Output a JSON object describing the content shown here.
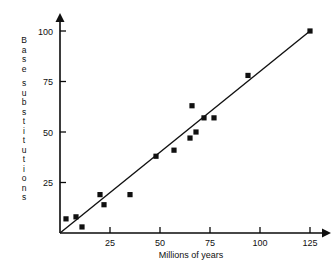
{
  "chart_data": {
    "type": "scatter",
    "title": "",
    "xlabel": "Millions of years",
    "ylabel": "Base substitutions",
    "ylabel_chars": [
      "B",
      "a",
      "s",
      "e",
      "",
      "s",
      "u",
      "b",
      "s",
      "t",
      "i",
      "t",
      "u",
      "t",
      "i",
      "o",
      "n",
      "s"
    ],
    "xlim": [
      0,
      132
    ],
    "ylim": [
      0,
      108
    ],
    "xticks": [
      25,
      50,
      75,
      100,
      125
    ],
    "xtick_labels": [
      "25",
      "50",
      "75",
      "100",
      "125"
    ],
    "yticks": [
      25,
      50,
      75,
      100
    ],
    "ytick_labels": [
      "25",
      "50",
      "75",
      "100"
    ],
    "grid": false,
    "legend": "none",
    "marker_style": "filled-square",
    "marker_color": "#101010",
    "line_color": "#111111",
    "axis_color": "#0a0a0a",
    "x": [
      3,
      8,
      11,
      20,
      22,
      35,
      48,
      57,
      65,
      66,
      68,
      72,
      77,
      94,
      125
    ],
    "y": [
      7,
      8,
      3,
      19,
      14,
      19,
      38,
      41,
      47,
      63,
      50,
      57,
      57,
      78,
      100
    ],
    "points": [
      {
        "x": 3,
        "y": 7
      },
      {
        "x": 8,
        "y": 8
      },
      {
        "x": 11,
        "y": 3
      },
      {
        "x": 20,
        "y": 19
      },
      {
        "x": 22,
        "y": 14
      },
      {
        "x": 35,
        "y": 19
      },
      {
        "x": 48,
        "y": 38
      },
      {
        "x": 57,
        "y": 41
      },
      {
        "x": 65,
        "y": 47
      },
      {
        "x": 66,
        "y": 63
      },
      {
        "x": 68,
        "y": 50
      },
      {
        "x": 72,
        "y": 57
      },
      {
        "x": 77,
        "y": 57
      },
      {
        "x": 94,
        "y": 78
      },
      {
        "x": 125,
        "y": 100
      }
    ],
    "trendline": {
      "type": "linear",
      "from": {
        "x": 0,
        "y": 0
      },
      "to": {
        "x": 125,
        "y": 100
      },
      "slope": 0.8,
      "intercept": 0
    }
  }
}
